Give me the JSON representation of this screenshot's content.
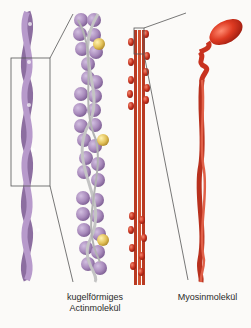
{
  "labels": {
    "actin": "kugelförmiges Actinmolekül",
    "actin_line1": "kugelförmiges",
    "actin_line2": "Actinmolekül",
    "myosin": "Myosinmolekül"
  },
  "colors": {
    "actin": "#a98bbc",
    "actin_dark": "#7d5e93",
    "troponin": "#e3c25a",
    "tropomyosin": "#b9b9b9",
    "myosin": "#c8321f",
    "myosin_head": "#d9341f",
    "background": "#fbfaf8",
    "line": "#555555"
  }
}
